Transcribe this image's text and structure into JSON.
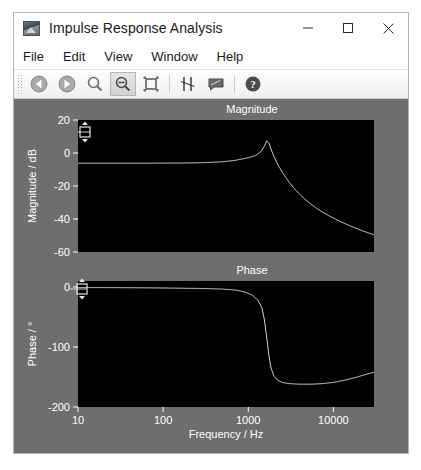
{
  "window": {
    "title": "Impulse Response Analysis",
    "icon": "chart-image-icon",
    "controls": {
      "minimize": "minimize-icon",
      "maximize": "maximize-icon",
      "close": "close-icon"
    }
  },
  "menubar": {
    "items": [
      {
        "label": "File"
      },
      {
        "label": "Edit"
      },
      {
        "label": "View"
      },
      {
        "label": "Window"
      },
      {
        "label": "Help"
      }
    ]
  },
  "toolbar": {
    "buttons": [
      {
        "name": "back-button",
        "icon": "back-arrow-icon",
        "active": false
      },
      {
        "name": "forward-button",
        "icon": "forward-arrow-icon",
        "active": false
      },
      {
        "name": "zoom-button",
        "icon": "magnifier-icon",
        "active": false
      },
      {
        "name": "zoom-horizontal-button",
        "icon": "magnifier-horizontal-icon",
        "active": true
      },
      {
        "name": "fit-view-button",
        "icon": "fit-rectangle-icon",
        "active": false
      },
      {
        "name": "cursors-button",
        "icon": "cursor-lines-icon",
        "active": false
      },
      {
        "name": "annotation-button",
        "icon": "note-icon",
        "active": false
      },
      {
        "name": "help-button",
        "icon": "help-question-icon",
        "active": false
      }
    ]
  },
  "colors": {
    "panel_background": "#6e6e6e",
    "plot_background": "#000000",
    "trace": "#dcdcdc",
    "axis_text": "#ffffff",
    "window_background": "#ffffff"
  },
  "chart_data": [
    {
      "id": "magnitude-plot",
      "type": "line",
      "title": "Magnitude",
      "xlabel": "",
      "ylabel": "Magnitude / dB",
      "xscale": "log",
      "xlim": [
        10,
        30000
      ],
      "ylim": [
        -60,
        20
      ],
      "xticks": [
        10,
        100,
        1000,
        10000
      ],
      "xticklabels": [
        "10",
        "100",
        "1000",
        "10000"
      ],
      "yticks": [
        20,
        0,
        -20,
        -40,
        -60
      ],
      "yticklabels": [
        "20",
        "0",
        "-20",
        "-40",
        "-60"
      ],
      "grid": false,
      "legend": null,
      "series": [
        {
          "name": "Magnitude",
          "x": [
            10,
            14,
            20,
            30,
            45,
            65,
            100,
            150,
            220,
            320,
            470,
            680,
            1000,
            1200,
            1400,
            1550,
            1650,
            1750,
            1850,
            2000,
            2200,
            2500,
            3000,
            3600,
            4500,
            5600,
            7000,
            9000,
            12000,
            16000,
            21000,
            27000,
            30000
          ],
          "y": [
            -6.2,
            -6.2,
            -6.2,
            -6.2,
            -6.2,
            -6.2,
            -6.1,
            -6.1,
            -6.0,
            -5.8,
            -5.4,
            -4.6,
            -2.9,
            -1.6,
            0.6,
            4.2,
            7.5,
            6.0,
            2.4,
            -2.0,
            -6.5,
            -11.5,
            -17.5,
            -22.5,
            -27.5,
            -31.5,
            -35.0,
            -38.2,
            -41.5,
            -44.3,
            -46.8,
            -48.8,
            -49.6
          ]
        }
      ],
      "cursor_handle": {
        "present": true,
        "x_value": 10,
        "y_value": 14
      }
    },
    {
      "id": "phase-plot",
      "type": "line",
      "title": "Phase",
      "xlabel": "Frequency / Hz",
      "ylabel": "Phase / °",
      "xscale": "log",
      "xlim": [
        10,
        30000
      ],
      "ylim": [
        -200,
        10
      ],
      "xticks": [
        10,
        100,
        1000,
        10000
      ],
      "xticklabels": [
        "10",
        "100",
        "1000",
        "10000"
      ],
      "yticks": [
        0,
        -100,
        -200
      ],
      "yticklabels": [
        "0",
        "-100",
        "-200"
      ],
      "grid": false,
      "legend": null,
      "series": [
        {
          "name": "Phase",
          "x": [
            10,
            20,
            40,
            80,
            150,
            300,
            500,
            700,
            900,
            1100,
            1300,
            1450,
            1550,
            1650,
            1750,
            1850,
            2000,
            2200,
            2500,
            3000,
            4000,
            5500,
            7500,
            10000,
            14000,
            19000,
            25000,
            30000
          ],
          "y": [
            -1,
            -1,
            -1.2,
            -1.5,
            -2,
            -2.5,
            -3.5,
            -5,
            -8,
            -13,
            -22,
            -35,
            -55,
            -85,
            -115,
            -135,
            -148,
            -155,
            -159,
            -161,
            -162,
            -162,
            -161,
            -159,
            -155,
            -150,
            -145,
            -142
          ]
        }
      ],
      "cursor_handle": {
        "present": true,
        "x_value": 10,
        "y_value": 0
      }
    }
  ]
}
